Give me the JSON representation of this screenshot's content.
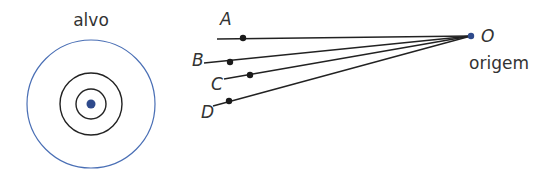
{
  "target": {
    "label": "alvo",
    "center": [
      91,
      104
    ],
    "rings": [
      {
        "r": 64,
        "color": "#4a6fb5",
        "width": 1.2
      },
      {
        "r": 31,
        "color": "#222222",
        "width": 1.4
      },
      {
        "r": 15,
        "color": "#222222",
        "width": 1.4
      }
    ],
    "bullseye": {
      "r": 4.5,
      "color": "#2e4a8c"
    }
  },
  "origin": {
    "label": "O",
    "caption": "origem",
    "point": [
      471,
      36
    ],
    "color": "#2e4a8c"
  },
  "lines": [
    {
      "label": "A",
      "start": [
        217,
        39
      ],
      "dot": [
        243,
        38
      ],
      "label_pos": [
        220,
        25
      ]
    },
    {
      "label": "B",
      "start": [
        204,
        63
      ],
      "dot": [
        230,
        62
      ],
      "label_pos": [
        192,
        66
      ]
    },
    {
      "label": "C",
      "start": [
        224,
        79
      ],
      "dot": [
        250,
        75
      ],
      "label_pos": [
        211,
        90
      ]
    },
    {
      "label": "D",
      "start": [
        213,
        106
      ],
      "dot": [
        229,
        101
      ],
      "label_pos": [
        201,
        118
      ]
    }
  ],
  "colors": {
    "line": "#222222",
    "dot": "#1a1a1a",
    "text": "#333333"
  }
}
